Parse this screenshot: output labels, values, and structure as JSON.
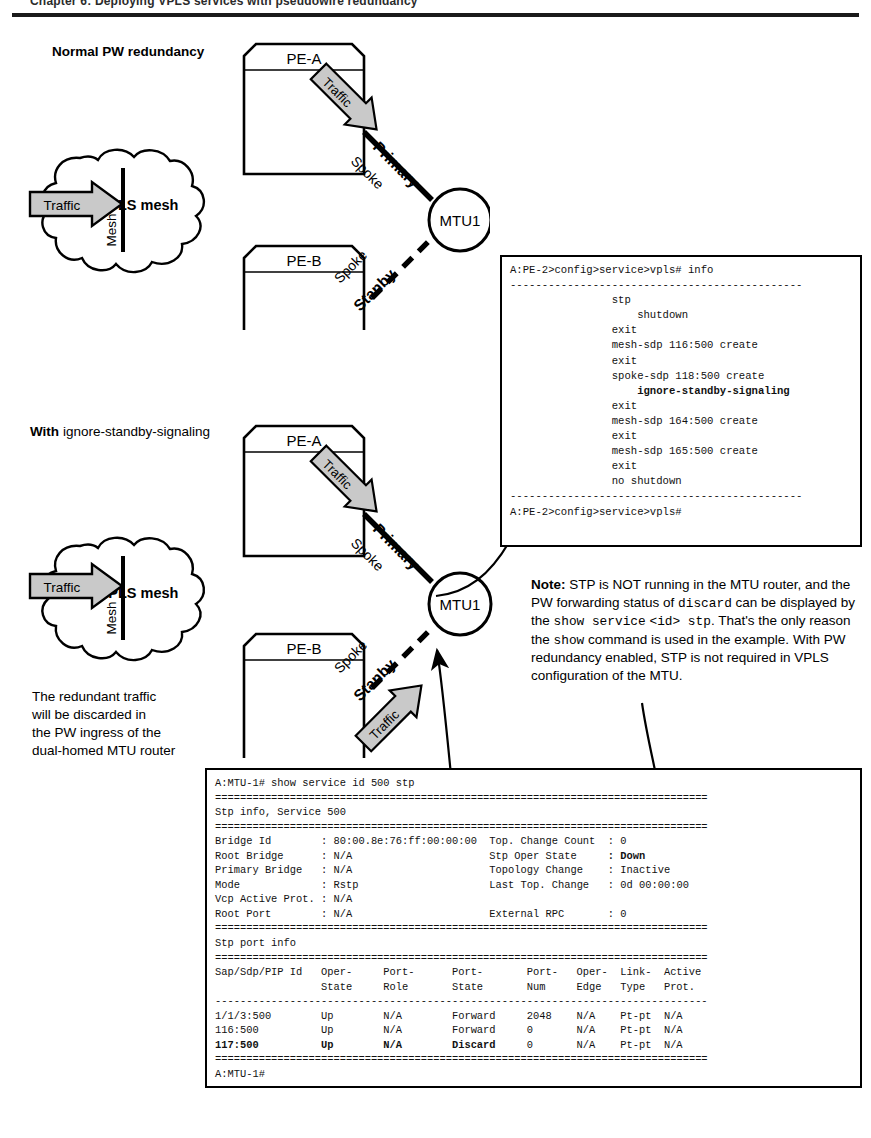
{
  "header": {
    "cut_off_text": "Chapter 6: Deploying VPLS services with pseudowire redundancy"
  },
  "sections": [
    {
      "id": "normal",
      "caption_bold": "Normal PW redundancy",
      "caption_rest": ""
    },
    {
      "id": "ignore",
      "caption_bold": "With",
      "caption_rest": " ignore-standby-signaling"
    }
  ],
  "diagram": {
    "node_pe_a": "PE-A",
    "node_pe_b": "PE-B",
    "cloud_label": "Core VPLS mesh",
    "mesh_link_label": "Mesh",
    "mtu_label": "MTU1",
    "primary_label": "Primary",
    "standby_label": "Stanby",
    "spoke_label_upper": "Spoke",
    "spoke_label_lower": "Spoke",
    "traffic_label": "Traffic"
  },
  "left_note": {
    "lines": [
      "The redundant traffic",
      "will be discarded in",
      "the PW ingress of the",
      "dual-homed MTU router"
    ]
  },
  "note": {
    "label": "Note:",
    "text_runs": [
      {
        "t": " STP is NOT running in the MTU router,",
        "mono": false
      },
      {
        "t": "and the PW forwarding status of ",
        "mono": false
      },
      {
        "t": "discard",
        "mono": true
      },
      {
        "t": "can be displayed by the ",
        "mono": false
      },
      {
        "t": "show service",
        "mono": true
      },
      {
        "t": "<id> stp",
        "mono": true
      },
      {
        "t": ". That's the only reason the",
        "mono": false
      },
      {
        "t": "show",
        "mono": true
      },
      {
        "t": " command is used in the example.",
        "mono": false
      },
      {
        "t": "With PW redundancy enabled, STP is not",
        "mono": false
      },
      {
        "t": "required in VPLS configuration of the MTU.",
        "mono": false
      }
    ]
  },
  "cli_config": {
    "prompt_top": "A:PE-2>config>service>vpls# info",
    "separator": "----------------------------------------------",
    "lines": [
      "                stp",
      "                    shutdown",
      "                exit",
      "                mesh-sdp 116:500 create",
      "                exit",
      "                spoke-sdp 118:500 create",
      "                    ignore-standby-signaling",
      "                exit",
      "                mesh-sdp 164:500 create",
      "                exit",
      "                mesh-sdp 165:500 create",
      "                exit",
      "                no shutdown"
    ],
    "bold_line_index": 6,
    "prompt_bottom": "A:PE-2>config>service>vpls#"
  },
  "cli_show": {
    "prompt_top": "A:MTU-1# show service id 500 stp",
    "heavy_sep": "===============================================================================",
    "light_sep": "-------------------------------------------------------------------------------",
    "title_1": "Stp info, Service 500",
    "info_rows": [
      {
        "label": "Bridge Id",
        "value": ": 80:00.8e:76:ff:00:00:00",
        "label2": "Top. Change Count",
        "value2": ": 0",
        "bold2": false
      },
      {
        "label": "Root Bridge",
        "value": ": N/A",
        "label2": "Stp Oper State",
        "value2": ": Down",
        "bold2": true
      },
      {
        "label": "Primary Bridge",
        "value": ": N/A",
        "label2": "Topology Change",
        "value2": ": Inactive",
        "bold2": false
      },
      {
        "label": "Mode",
        "value": ": Rstp",
        "label2": "Last Top. Change",
        "value2": ": 0d 00:00:00",
        "bold2": false
      },
      {
        "label": "Vcp Active Prot.",
        "value": ": N/A",
        "label2": "",
        "value2": "",
        "bold2": false
      },
      {
        "label": "Root Port",
        "value": ": N/A",
        "label2": "External RPC",
        "value2": ": 0",
        "bold2": false
      }
    ],
    "title_2": "Stp port info",
    "columns_line1": [
      "Sap/Sdp/PIP Id",
      "Oper-",
      "Port-",
      "Port-",
      "Port-",
      "Oper-",
      "Link-",
      "Active"
    ],
    "columns_line2": [
      "",
      "State",
      "Role",
      "State",
      "Num",
      "Edge",
      "Type",
      "Prot."
    ],
    "rows": [
      {
        "cells": [
          "1/1/3:500",
          "Up",
          "N/A",
          "Forward",
          "2048",
          "N/A",
          "Pt-pt",
          "N/A"
        ],
        "bold": false
      },
      {
        "cells": [
          "116:500",
          "Up",
          "N/A",
          "Forward",
          "0",
          "N/A",
          "Pt-pt",
          "N/A"
        ],
        "bold": false
      },
      {
        "cells": [
          "117:500",
          "Up",
          "N/A",
          "Discard",
          "0",
          "N/A",
          "Pt-pt",
          "N/A"
        ],
        "bold": true
      }
    ],
    "prompt_bottom": "A:MTU-1#"
  },
  "colors": {
    "line": "#000000",
    "arrow_fill": "#c9c9c9",
    "arrow_stroke": "#000000",
    "paper": "#ffffff"
  }
}
